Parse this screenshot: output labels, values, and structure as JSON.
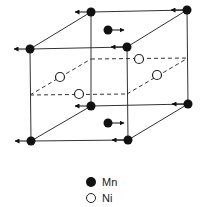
{
  "diagram": {
    "title": "",
    "type": "crystal-unit-cell",
    "colors": {
      "line": "#333333",
      "mn": "#111111",
      "ni_fill": "#ffffff"
    },
    "edges_solid": [
      [
        [
          30,
          49
        ],
        [
          127,
          47
        ]
      ],
      [
        [
          30,
          49
        ],
        [
          91,
          12
        ]
      ],
      [
        [
          91,
          12
        ],
        [
          187,
          10
        ]
      ],
      [
        [
          127,
          47
        ],
        [
          187,
          10
        ]
      ],
      [
        [
          30,
          49
        ],
        [
          31,
          141
        ]
      ],
      [
        [
          127,
          47
        ],
        [
          128,
          140
        ]
      ],
      [
        [
          187,
          10
        ],
        [
          188,
          104
        ]
      ],
      [
        [
          91,
          12
        ],
        [
          91,
          106
        ]
      ],
      [
        [
          31,
          141
        ],
        [
          128,
          140
        ]
      ],
      [
        [
          31,
          141
        ],
        [
          91,
          106
        ]
      ],
      [
        [
          91,
          106
        ],
        [
          188,
          104
        ]
      ],
      [
        [
          128,
          140
        ],
        [
          188,
          104
        ]
      ]
    ],
    "edges_dashed": [
      [
        [
          30,
          95
        ],
        [
          127,
          94
        ]
      ],
      [
        [
          30,
          95
        ],
        [
          91,
          59
        ]
      ],
      [
        [
          91,
          59
        ],
        [
          188,
          58
        ]
      ],
      [
        [
          127,
          94
        ],
        [
          188,
          58
        ]
      ]
    ],
    "mn_atoms": [
      {
        "x": 91,
        "y": 12,
        "arrow": "left"
      },
      {
        "x": 187,
        "y": 10,
        "arrow": "left"
      },
      {
        "x": 30,
        "y": 49,
        "arrow": "left"
      },
      {
        "x": 127,
        "y": 47,
        "arrow": "left"
      },
      {
        "x": 108,
        "y": 30,
        "arrow": "right"
      },
      {
        "x": 91,
        "y": 106,
        "arrow": "left"
      },
      {
        "x": 188,
        "y": 104,
        "arrow": "left"
      },
      {
        "x": 31,
        "y": 141,
        "arrow": "left"
      },
      {
        "x": 128,
        "y": 140,
        "arrow": "left"
      },
      {
        "x": 108,
        "y": 123,
        "arrow": "right"
      }
    ],
    "ni_atoms": [
      {
        "x": 139,
        "y": 59
      },
      {
        "x": 60,
        "y": 77
      },
      {
        "x": 157,
        "y": 75
      },
      {
        "x": 79,
        "y": 94
      }
    ]
  },
  "legend": {
    "items": [
      {
        "symbol": "filled-circle",
        "label": "Mn"
      },
      {
        "symbol": "open-circle",
        "label": "Ni"
      }
    ]
  }
}
